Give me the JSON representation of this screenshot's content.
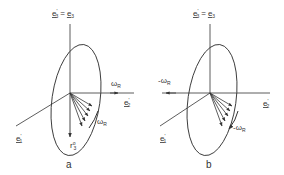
{
  "panels": [
    {
      "id": "a",
      "caption": "a",
      "axis_top": {
        "lhs": "e",
        "lhs_sup": "'",
        "lhs_sub": "3",
        "eq": "=",
        "rhs": "e",
        "rhs_sub": "3"
      },
      "axis_right": {
        "base": "e",
        "sup": "'",
        "sub": "2"
      },
      "axis_left": {
        "base": "e",
        "sup": "'",
        "sub": "1"
      },
      "omega_axis": {
        "base": "ω",
        "sub": "R"
      },
      "omega_arc": {
        "base": "ω",
        "sub": "R"
      },
      "r_label": {
        "base": "r",
        "sup": "o",
        "sub": "3"
      }
    },
    {
      "id": "b",
      "caption": "b",
      "axis_top": {
        "lhs": "e",
        "lhs_sup": "'",
        "lhs_sub": "3",
        "eq": "=",
        "rhs": "e",
        "rhs_sub": "3"
      },
      "axis_right": {
        "base": "e",
        "sup": "'",
        "sub": "2"
      },
      "axis_left": {
        "base": "e",
        "sup": "'",
        "sub": "1"
      },
      "omega_axis": {
        "base": "-ω",
        "sub": "R"
      },
      "omega_arc": {
        "base": "-ω",
        "sub": "R"
      }
    }
  ],
  "colors": {
    "line": "#333333",
    "background": "#ffffff"
  }
}
